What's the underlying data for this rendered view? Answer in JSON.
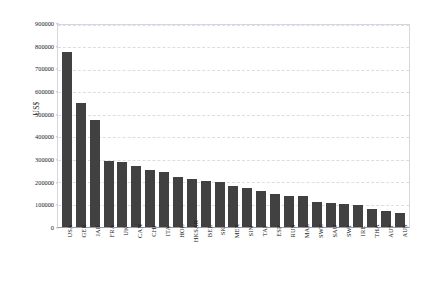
{
  "chart_data": {
    "type": "bar",
    "title": "",
    "xlabel": "",
    "ylabel": "US$",
    "ylim": [
      0,
      900000
    ],
    "ytick_labels": [
      "900000",
      "800000",
      "700000",
      "600000",
      "500000",
      "400000",
      "300000",
      "200000",
      "100000",
      "0"
    ],
    "ytick_values": [
      900000,
      800000,
      700000,
      600000,
      500000,
      400000,
      300000,
      200000,
      100000,
      0
    ],
    "grid": true,
    "grid_style": "dashed-horizontal",
    "legend": "none",
    "bar_color": "#414141",
    "grid_color": "#dcdce8",
    "axis_color": "#9a9aa4",
    "background_color": "#ffffff",
    "categories": [
      "USA",
      "GER",
      "JAP",
      "FRA",
      "UK",
      "CAN",
      "CHI",
      "ITA",
      "HOL",
      "HKSAR",
      "BEL",
      "SK",
      "MEX",
      "SIN",
      "TAI",
      "ESP",
      "RUS",
      "MAL",
      "SWE",
      "SAU",
      "SWI",
      "IRE",
      "THA",
      "AUT",
      "AUS"
    ],
    "values": [
      780000,
      552000,
      478000,
      295000,
      288000,
      272000,
      256000,
      243000,
      225000,
      213000,
      205000,
      200000,
      184000,
      172000,
      160000,
      148000,
      140000,
      137000,
      110000,
      105000,
      103000,
      100000,
      82000,
      72000,
      62000
    ]
  }
}
